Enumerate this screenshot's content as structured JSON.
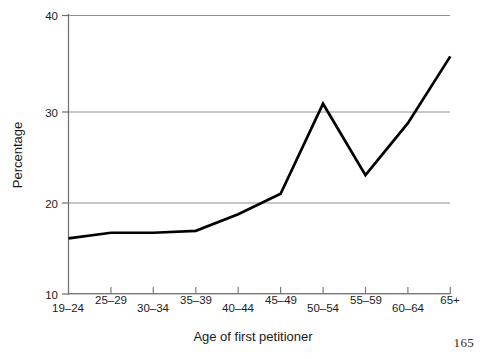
{
  "page": {
    "page_number": "165"
  },
  "chart_data": {
    "type": "line",
    "title": "",
    "xlabel": "Age of first petitioner",
    "ylabel": "Percentage",
    "categories": [
      "19–24",
      "25–29",
      "30–34",
      "35–39",
      "40–44",
      "45–49",
      "50–54",
      "55–59",
      "60–64",
      "65+"
    ],
    "values": [
      16.0,
      16.6,
      16.6,
      16.8,
      18.6,
      20.8,
      30.5,
      22.8,
      28.4,
      35.6
    ],
    "series": [
      {
        "name": "Percentage",
        "values": [
          16.0,
          16.6,
          16.6,
          16.8,
          18.6,
          20.8,
          30.5,
          22.8,
          28.4,
          35.6
        ]
      }
    ],
    "ylim": [
      10,
      40
    ],
    "yticks": [
      10,
      20,
      30,
      40
    ],
    "ytick_labels": [
      "10",
      "20",
      "30",
      "40"
    ],
    "grid": true,
    "grid_axis": "y",
    "legend": "none",
    "line_color": "#000000",
    "grid_color": "#9a9a9a",
    "axis_color": "#6e6e6e",
    "background": "#ffffff"
  }
}
